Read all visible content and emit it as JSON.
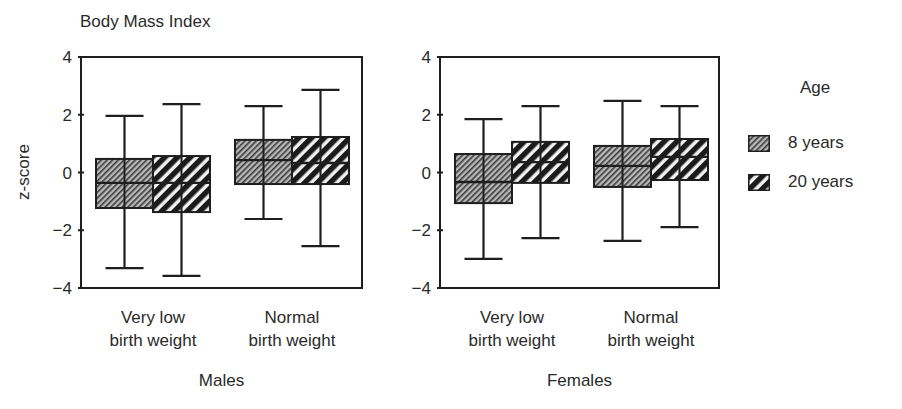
{
  "chart_data": {
    "type": "boxplot",
    "title": "Body Mass Index",
    "ylabel": "z-score",
    "ylim": [
      -4,
      4
    ],
    "yticks": [
      4,
      2,
      0,
      -2,
      -4
    ],
    "ytick_labels": [
      "4",
      "2",
      "0",
      "−2",
      "−4"
    ],
    "grid": false,
    "legend": {
      "title": "Age",
      "position": "right",
      "entries": [
        {
          "label": "8 years",
          "pattern": "fine-hatch"
        },
        {
          "label": "20 years",
          "pattern": "bold-stripe"
        }
      ]
    },
    "panels": [
      {
        "name": "Males",
        "categories": [
          "Very low\nbirth weight",
          "Normal\nbirth weight"
        ],
        "series": [
          {
            "name": "8 years",
            "boxes": [
              {
                "whisker_high": 1.96,
                "q3": 0.47,
                "median": -0.36,
                "q1": -1.23,
                "whisker_low": -3.31
              },
              {
                "whisker_high": 2.3,
                "q3": 1.13,
                "median": 0.43,
                "q1": -0.4,
                "whisker_low": -1.61
              }
            ]
          },
          {
            "name": "20 years",
            "boxes": [
              {
                "whisker_high": 2.37,
                "q3": 0.57,
                "median": -0.36,
                "q1": -1.37,
                "whisker_low": -3.58
              },
              {
                "whisker_high": 2.86,
                "q3": 1.23,
                "median": 0.33,
                "q1": -0.4,
                "whisker_low": -2.55
              }
            ]
          }
        ]
      },
      {
        "name": "Females",
        "categories": [
          "Very low\nbirth weight",
          "Normal\nbirth weight"
        ],
        "series": [
          {
            "name": "8 years",
            "boxes": [
              {
                "whisker_high": 1.85,
                "q3": 0.64,
                "median": -0.33,
                "q1": -1.06,
                "whisker_low": -2.99
              },
              {
                "whisker_high": 2.48,
                "q3": 0.92,
                "median": 0.23,
                "q1": -0.5,
                "whisker_low": -2.37
              }
            ]
          },
          {
            "name": "20 years",
            "boxes": [
              {
                "whisker_high": 2.3,
                "q3": 1.06,
                "median": 0.36,
                "q1": -0.36,
                "whisker_low": -2.27
              },
              {
                "whisker_high": 2.3,
                "q3": 1.16,
                "median": 0.54,
                "q1": -0.26,
                "whisker_low": -1.89
              }
            ]
          }
        ]
      }
    ]
  },
  "labels": {
    "title": "Body Mass Index",
    "ylabel": "z-score",
    "legend_title": "Age",
    "legend_items": [
      "8 years",
      "20 years"
    ]
  },
  "colors": {
    "axis": "#1e1e1e",
    "text": "#2a2a2a",
    "hatch_fine_bg": "#b8b8b8",
    "hatch_fine_line": "#3a3a3a",
    "stripe_bg": "#f2f2f2",
    "stripe_line": "#1a1a1a"
  }
}
